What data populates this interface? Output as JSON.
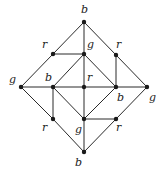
{
  "diagram": {
    "type": "graph",
    "vertices": [
      {
        "id": "v0",
        "label": "b",
        "x": 84,
        "y": 22,
        "lx": 81,
        "ly": 13
      },
      {
        "id": "v1",
        "label": "r",
        "x": 53,
        "y": 54,
        "lx": 42,
        "ly": 48
      },
      {
        "id": "v2",
        "label": "g",
        "x": 84,
        "y": 54,
        "lx": 87,
        "ly": 48
      },
      {
        "id": "v3",
        "label": "r",
        "x": 116,
        "y": 55,
        "lx": 116,
        "ly": 48
      },
      {
        "id": "v4",
        "label": "g",
        "x": 21,
        "y": 87,
        "lx": 9,
        "ly": 83
      },
      {
        "id": "v5",
        "label": "b",
        "x": 53,
        "y": 87,
        "lx": 45,
        "ly": 81
      },
      {
        "id": "v6",
        "label": "r",
        "x": 84,
        "y": 87,
        "lx": 87,
        "ly": 81
      },
      {
        "id": "v7",
        "label": "b",
        "x": 116,
        "y": 87,
        "lx": 117,
        "ly": 101
      },
      {
        "id": "v8",
        "label": "g",
        "x": 147,
        "y": 87,
        "lx": 149,
        "ly": 101
      },
      {
        "id": "v9",
        "label": "r",
        "x": 53,
        "y": 119,
        "lx": 42,
        "ly": 131
      },
      {
        "id": "v10",
        "label": "g",
        "x": 84,
        "y": 119,
        "lx": 75,
        "ly": 133
      },
      {
        "id": "v11",
        "label": "r",
        "x": 116,
        "y": 119,
        "lx": 116,
        "ly": 131
      },
      {
        "id": "v12",
        "label": "b",
        "x": 84,
        "y": 152,
        "lx": 75,
        "ly": 166
      }
    ],
    "edges": [
      [
        "v0",
        "v1"
      ],
      [
        "v1",
        "v4"
      ],
      [
        "v0",
        "v2"
      ],
      [
        "v2",
        "v6"
      ],
      [
        "v0",
        "v3"
      ],
      [
        "v3",
        "v8"
      ],
      [
        "v1",
        "v2"
      ],
      [
        "v2",
        "v5"
      ],
      [
        "v2",
        "v7"
      ],
      [
        "v3",
        "v7"
      ],
      [
        "v4",
        "v5"
      ],
      [
        "v5",
        "v6"
      ],
      [
        "v6",
        "v7"
      ],
      [
        "v7",
        "v8"
      ],
      [
        "v4",
        "v9"
      ],
      [
        "v9",
        "v12"
      ],
      [
        "v5",
        "v9"
      ],
      [
        "v5",
        "v10"
      ],
      [
        "v7",
        "v10"
      ],
      [
        "v6",
        "v10"
      ],
      [
        "v10",
        "v12"
      ],
      [
        "v10",
        "v11"
      ],
      [
        "v8",
        "v11"
      ],
      [
        "v11",
        "v12"
      ]
    ]
  }
}
